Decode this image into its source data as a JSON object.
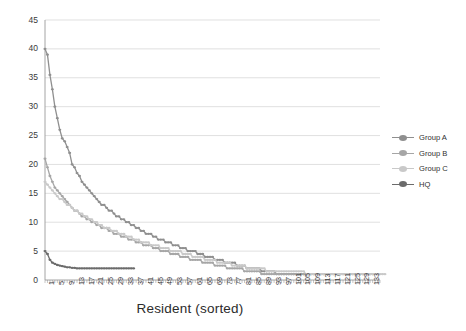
{
  "chart_data": {
    "type": "line",
    "title": "",
    "xlabel": "Resident (sorted)",
    "ylabel": "",
    "ylim": [
      0,
      45
    ],
    "ytick_step": 5,
    "yticks": [
      "0",
      "5",
      "10",
      "15",
      "20",
      "25",
      "30",
      "35",
      "40",
      "45"
    ],
    "xlim": [
      1,
      137
    ],
    "xtick_step": 4,
    "xticks": [
      "1",
      "5",
      "9",
      "13",
      "17",
      "21",
      "25",
      "29",
      "33",
      "37",
      "41",
      "45",
      "49",
      "53",
      "57",
      "61",
      "65",
      "69",
      "73",
      "77",
      "81",
      "85",
      "89",
      "93",
      "97",
      "101",
      "105",
      "109",
      "113",
      "117",
      "121",
      "125",
      "129",
      "133"
    ],
    "grid": "horizontal",
    "legend_position": "right",
    "series": [
      {
        "name": "Group A",
        "color": "#8f8f8f",
        "values": [
          40,
          39,
          35.5,
          33,
          30,
          28,
          26,
          24.5,
          24,
          23,
          22,
          20,
          19.5,
          18.5,
          18,
          17,
          16.5,
          16,
          15.5,
          15,
          14.5,
          14,
          13.5,
          13,
          13,
          12.5,
          12,
          12,
          11.5,
          11,
          11,
          10.5,
          10.5,
          10,
          10,
          9.5,
          9.5,
          9,
          9,
          8.5,
          8.5,
          8,
          8,
          8,
          7.5,
          7.5,
          7,
          7,
          7,
          6.5,
          6.5,
          6.5,
          6,
          6,
          6,
          5.5,
          5.5,
          5.5,
          5,
          5,
          5,
          5,
          4.5,
          4.5,
          4.5,
          4,
          4,
          4,
          4,
          3.5,
          3.5,
          3.5,
          3.5,
          3,
          3,
          3,
          3,
          3,
          2.5,
          2.5,
          2.5,
          2.5,
          2,
          2,
          2,
          2,
          2,
          2,
          1.5,
          1.5,
          1.5,
          1.5,
          1.5,
          1.5,
          1,
          1,
          1,
          1,
          1,
          1,
          1,
          1,
          1,
          1,
          1,
          1,
          1,
          1
        ]
      },
      {
        "name": "Group B",
        "color": "#a6a6a6",
        "values": [
          21,
          19.5,
          18,
          17,
          16,
          15.5,
          15,
          14.5,
          14,
          13.5,
          13,
          12.5,
          12,
          12,
          11.5,
          11,
          11,
          10.5,
          10.5,
          10,
          10,
          9.5,
          9.5,
          9,
          9,
          9,
          8.5,
          8.5,
          8,
          8,
          8,
          7.5,
          7.5,
          7.5,
          7,
          7,
          7,
          6.5,
          6.5,
          6.5,
          6,
          6,
          6,
          6,
          5.5,
          5.5,
          5.5,
          5,
          5,
          5,
          5,
          4.5,
          4.5,
          4.5,
          4.5,
          4,
          4,
          4,
          4,
          3.5,
          3.5,
          3.5,
          3.5,
          3.5,
          3,
          3,
          3,
          3,
          3,
          2.5,
          2.5,
          2.5,
          2.5,
          2.5,
          2,
          2,
          2,
          2,
          2,
          2,
          2,
          1.5,
          1.5,
          1.5,
          1.5,
          1.5,
          1.5,
          1.5,
          1,
          1,
          1,
          1,
          1,
          1,
          1,
          1,
          1,
          1,
          1,
          1,
          1,
          1,
          1,
          1,
          1,
          1,
          1,
          1,
          1,
          1,
          1,
          1,
          1,
          1,
          1,
          1,
          1,
          1,
          1,
          1,
          1,
          1,
          1,
          1,
          1,
          1,
          1,
          1,
          1,
          1,
          1,
          1,
          1,
          1
        ]
      },
      {
        "name": "Group C",
        "color": "#c9c9c9",
        "values": [
          17,
          16.5,
          16,
          15.5,
          15,
          14.5,
          14,
          14,
          13.5,
          13,
          13,
          12.5,
          12,
          12,
          11.5,
          11.5,
          11,
          11,
          10.5,
          10.5,
          10,
          10,
          9.5,
          9.5,
          9,
          9,
          9,
          8.5,
          8.5,
          8.5,
          8,
          8,
          8,
          7.5,
          7.5,
          7.5,
          7,
          7,
          7,
          6.5,
          6.5,
          6.5,
          6.5,
          6,
          6,
          6,
          6,
          5.5,
          5.5,
          5.5,
          5.5,
          5,
          5,
          5,
          5,
          5,
          4.5,
          4.5,
          4.5,
          4.5,
          4,
          4,
          4,
          4,
          4,
          3.5,
          3.5,
          3.5,
          3.5,
          3.5,
          3,
          3,
          3,
          3,
          3,
          3,
          2.5,
          2.5,
          2.5,
          2.5,
          2.5,
          2.5,
          2,
          2,
          2,
          2,
          2,
          2,
          2,
          2,
          1.5,
          1.5,
          1.5,
          1.5,
          1.5,
          1.5,
          1.5,
          1.5,
          1.5,
          1.5,
          1.5,
          1.5,
          1.5,
          1.5,
          1.5,
          1.5,
          1,
          1,
          1,
          1,
          1,
          1,
          1,
          1,
          1,
          1,
          1,
          1,
          1,
          1,
          1,
          1,
          1,
          1,
          1,
          1,
          1,
          1,
          1,
          1,
          1,
          1,
          1,
          1,
          1,
          1,
          1,
          1,
          1
        ]
      },
      {
        "name": "HQ",
        "color": "#6b6b6b",
        "values": [
          5,
          4.5,
          3.5,
          3,
          2.8,
          2.6,
          2.5,
          2.4,
          2.3,
          2.2,
          2.2,
          2.1,
          2.1,
          2,
          2,
          2,
          2,
          2,
          2,
          2,
          2,
          2,
          2,
          2,
          2,
          2,
          2,
          2,
          2,
          2,
          2,
          2,
          2,
          2,
          2,
          2,
          2
        ]
      }
    ]
  },
  "legend": {
    "items": [
      {
        "label": "Group A"
      },
      {
        "label": "Group B"
      },
      {
        "label": "Group C"
      },
      {
        "label": "HQ"
      }
    ]
  }
}
